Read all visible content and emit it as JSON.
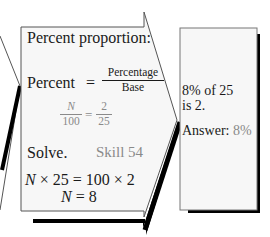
{
  "colors": {
    "text": "#1a1a1a",
    "accent_gray": "#8a8a8a",
    "panel_fill": "#f7f7f7",
    "outline": "#555555",
    "shadow": "#000000"
  },
  "arrow_panel": {
    "heading": "Percent proportion:",
    "formula": {
      "lhs": "Percent",
      "equals": "=",
      "numerator": "Percentage",
      "denominator": "Base"
    },
    "proportion": {
      "left_num": "N",
      "left_den": "100",
      "equals": "=",
      "right_num": "2",
      "right_den": "25"
    },
    "solve_label": "Solve.",
    "skill_ref": "Skill 54",
    "equation_1": {
      "var": "N",
      "rest": " × 25 = 100 × 2"
    },
    "equation_2": {
      "var": "N",
      "rest": " = 8"
    }
  },
  "answer_panel": {
    "statement_line1": "8% of 25",
    "statement_line2": "is 2.",
    "answer_label": "Answer:",
    "answer_value": "8%"
  }
}
